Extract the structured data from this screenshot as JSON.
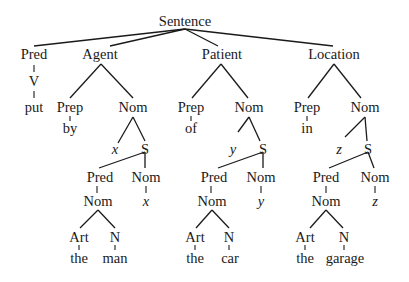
{
  "diagram": {
    "type": "syntax-tree",
    "root": "Sentence",
    "nodes": {
      "root": "Sentence",
      "pred": "Pred",
      "pred_v": "V",
      "pred_put": "put",
      "agent": "Agent",
      "agent_prep": "Prep",
      "agent_by": "by",
      "agent_nom": "Nom",
      "agent_var": "x",
      "agent_s": "S",
      "agent_s_pred": "Pred",
      "agent_s_nom": "Nom",
      "agent_s_pred_nom": "Nom",
      "agent_s_nom_var": "x",
      "agent_art": "Art",
      "agent_n": "N",
      "agent_the": "the",
      "agent_noun": "man",
      "patient": "Patient",
      "patient_prep": "Prep",
      "patient_of": "of",
      "patient_nom": "Nom",
      "patient_var": "y",
      "patient_s": "S",
      "patient_s_pred": "Pred",
      "patient_s_nom": "Nom",
      "patient_s_pred_nom": "Nom",
      "patient_s_nom_var": "y",
      "patient_art": "Art",
      "patient_n": "N",
      "patient_the": "the",
      "patient_noun": "car",
      "location": "Location",
      "location_prep": "Prep",
      "location_in": "in",
      "location_nom": "Nom",
      "location_var": "z",
      "location_s": "S",
      "location_s_pred": "Pred",
      "location_s_nom": "Nom",
      "location_s_pred_nom": "Nom",
      "location_s_nom_var": "z",
      "location_art": "Art",
      "location_n": "N",
      "location_the": "the",
      "location_noun": "garage"
    }
  }
}
